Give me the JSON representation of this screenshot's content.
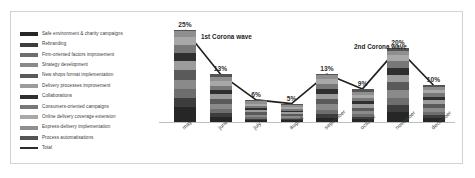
{
  "chart_data": {
    "type": "bar",
    "title": "",
    "subtitle": "",
    "xlabel": "",
    "ylabel": "",
    "ylim": [
      0,
      25
    ],
    "grid": false,
    "legend_position": "left",
    "categories": [
      "may",
      "june",
      "july",
      "august",
      "september",
      "october",
      "november",
      "december"
    ],
    "totals": [
      25,
      13,
      6,
      5,
      13,
      9,
      20,
      10
    ],
    "total_labels": [
      "25%",
      "13%",
      "6%",
      "5%",
      "13%",
      "9%",
      "20%",
      "10%"
    ],
    "series": [
      {
        "name": "Safe environment & charity campaigns",
        "color": "#262626",
        "values": [
          4.0,
          1.4,
          0.5,
          0.4,
          1.1,
          0.8,
          2.6,
          1.1
        ]
      },
      {
        "name": "Rebranding",
        "color": "#3d3d3d",
        "values": [
          2.6,
          1.0,
          0.4,
          0.3,
          0.9,
          0.6,
          1.9,
          0.8
        ]
      },
      {
        "name": "Firm-oriented factors improvement",
        "color": "#6e6e6e",
        "values": [
          2.4,
          1.1,
          0.5,
          0.4,
          1.1,
          0.7,
          2.0,
          0.9
        ]
      },
      {
        "name": "Strategy development",
        "color": "#8a8a8a",
        "values": [
          2.5,
          1.3,
          0.6,
          0.5,
          1.3,
          0.9,
          2.1,
          1.0
        ]
      },
      {
        "name": "New shops format implementation",
        "color": "#5a5a5a",
        "values": [
          2.6,
          1.4,
          0.6,
          0.5,
          1.4,
          0.9,
          2.2,
          1.1
        ]
      },
      {
        "name": "Delivery processes improvement",
        "color": "#9c9c9c",
        "values": [
          2.4,
          1.3,
          0.6,
          0.5,
          1.3,
          0.9,
          2.0,
          1.0
        ]
      },
      {
        "name": "Collaborations",
        "color": "#2f2f2f",
        "values": [
          2.3,
          1.2,
          0.6,
          0.5,
          1.2,
          0.9,
          1.9,
          1.0
        ]
      },
      {
        "name": "Consumers-oriented campaigns",
        "color": "#787878",
        "values": [
          2.2,
          1.2,
          0.6,
          0.5,
          1.2,
          0.9,
          1.8,
          0.9
        ]
      },
      {
        "name": "Online delivery coverage extension",
        "color": "#a8a8a8",
        "values": [
          2.0,
          1.2,
          0.6,
          0.5,
          1.2,
          0.8,
          1.6,
          0.9
        ]
      },
      {
        "name": "Express-delivery implementation",
        "color": "#8f8f8f",
        "values": [
          1.6,
          1.1,
          0.6,
          0.5,
          1.1,
          0.8,
          1.2,
          0.8
        ]
      },
      {
        "name": "Process automatisations",
        "color": "#545454",
        "values": [
          0.4,
          0.8,
          0.4,
          0.4,
          0.2,
          0.8,
          0.7,
          0.5
        ]
      }
    ],
    "line_series": {
      "name": "Total",
      "color": "#1f1f1f",
      "values": [
        25,
        13,
        6,
        5,
        13,
        9,
        20,
        10
      ]
    },
    "annotations": [
      {
        "text": "1st Corona wave",
        "near_category": "june"
      },
      {
        "text": "2nd Corona wave",
        "near_category": "november"
      }
    ]
  },
  "legend": {
    "items": [
      {
        "label": "Safe environment & charity campaigns",
        "color": "#262626"
      },
      {
        "label": "Rebranding",
        "color": "#3d3d3d"
      },
      {
        "label": "Firm-oriented factors improvement",
        "color": "#6e6e6e"
      },
      {
        "label": "Strategy development",
        "color": "#8a8a8a"
      },
      {
        "label": "New shops format implementation",
        "color": "#5a5a5a"
      },
      {
        "label": "Delivery processes improvement",
        "color": "#9c9c9c"
      },
      {
        "label": "Collaborations",
        "color": "#2f2f2f"
      },
      {
        "label": "Consumers-oriented campaigns",
        "color": "#787878"
      },
      {
        "label": "Online delivery coverage extension",
        "color": "#a8a8a8"
      },
      {
        "label": "Express-delivery implementation",
        "color": "#8f8f8f"
      },
      {
        "label": "Process automatisations",
        "color": "#545454"
      },
      {
        "label": "Total",
        "color": "#1f1f1f"
      }
    ]
  }
}
